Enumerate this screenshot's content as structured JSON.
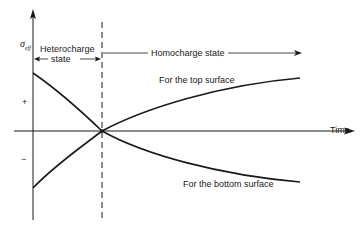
{
  "diagram": {
    "y_axis_label": "σ",
    "y_axis_label_sub": "eff",
    "x_axis_label": "Time",
    "plus_sign": "+",
    "minus_sign": "−",
    "regions": {
      "heterocharge_line1": "Heterocharge",
      "heterocharge_line2": "state",
      "homocharge": "Homocharge state"
    },
    "curves": {
      "top": "For the top surface",
      "bottom": "For the bottom surface"
    },
    "colors": {
      "ink": "#1a1a1a",
      "background": "#ffffff"
    }
  }
}
